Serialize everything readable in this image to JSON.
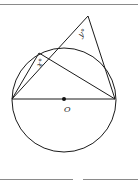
{
  "figure": {
    "type": "geometry-diagram",
    "labels": {
      "center": "O",
      "angle_x": "x°",
      "angle_y": "y°"
    },
    "colors": {
      "stroke": "#1a1a1a",
      "rule": "#8a8a8a",
      "background": "#ffffff"
    },
    "points": {
      "A": [
        12,
        99
      ],
      "B": [
        115,
        99
      ],
      "O": [
        64,
        99
      ],
      "C": [
        39,
        53
      ],
      "P": [
        88,
        16
      ]
    },
    "circle": {
      "cx": 64,
      "cy": 100,
      "r": 52
    }
  }
}
